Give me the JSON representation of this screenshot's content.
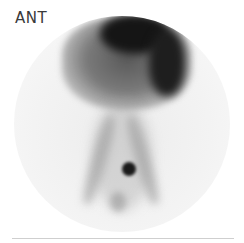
{
  "view_label": "ANT",
  "image": {
    "description": "Anterior nuclear medicine scintigraphy image with dark upper uptake region, diverging vertical tracts and small focal dark spot lower center",
    "colors": {
      "background": "#ffffff",
      "field": "#efefef",
      "dense": "#141414",
      "mid": "#6e6e6e",
      "faint": "#c8c8c8"
    }
  }
}
